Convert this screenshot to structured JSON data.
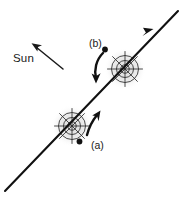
{
  "figure": {
    "background_color": "#ffffff",
    "ink_color": "#111111",
    "halo_color": "#d8d8d8",
    "width": 184,
    "height": 197
  },
  "labels": {
    "sun": "Sun",
    "point_a": "(a)",
    "point_b": "(b)"
  },
  "annotations": {
    "sun_arrow": {
      "name": "sun-direction-arrow",
      "description": "straight arrow pointing toward the Sun (up-left)",
      "from": [
        62,
        68
      ],
      "to": [
        33,
        44
      ]
    },
    "trajectory": {
      "name": "trajectory-line",
      "description": "diagonal motion line with arrowhead toward upper right",
      "from": [
        6,
        190
      ],
      "to": [
        177,
        12
      ],
      "arrowhead_at": [
        150,
        32
      ]
    },
    "spin_arrow_a": {
      "name": "rotation-arrow-a",
      "description": "curved arrow near lower body, arrowhead pointing up",
      "direction": "counterclockwise"
    },
    "spin_arrow_b": {
      "name": "rotation-arrow-b",
      "description": "curved arrow near upper body, arrowhead pointing down",
      "direction": "counterclockwise"
    }
  },
  "bodies": [
    {
      "name": "nucleus-lower",
      "label": "(a)",
      "center": [
        72,
        126
      ],
      "radius": 18,
      "spokes": 8,
      "rings": 3,
      "marker_dot": [
        79,
        141
      ]
    },
    {
      "name": "nucleus-upper",
      "label": "(b)",
      "center": [
        125,
        69
      ],
      "radius": 18,
      "spokes": 8,
      "rings": 3,
      "marker_dot": [
        104,
        49
      ]
    }
  ]
}
